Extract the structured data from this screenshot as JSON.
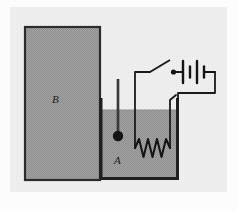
{
  "figure": {
    "type": "physics-apparatus-diagram",
    "width": 237,
    "height": 211,
    "background_color": "#f0f0f0",
    "frame_color": "#e8e8e8"
  },
  "labels": {
    "block": "B",
    "liquid": "A"
  },
  "components": {
    "block": {
      "name": "block-b",
      "shape": "rectangle",
      "fill_color": "#9b9b9b",
      "stroke_color": "#2b2b2b",
      "x": 25,
      "y": 27,
      "width": 75,
      "height": 153
    },
    "container": {
      "name": "beaker-container",
      "stroke_color": "#1f1f1f",
      "left_wall_x": 100,
      "right_wall_x": 178,
      "top_y": 98,
      "bottom_y": 180
    },
    "liquid": {
      "name": "liquid-a",
      "fill_color": "#9b9b9b",
      "surface_y": 110,
      "bottom_y": 177
    },
    "thermometer": {
      "name": "thermometer",
      "stem_color": "#2b2b2b",
      "bulb_color": "#1a1a1a",
      "x": 118,
      "top_y": 78,
      "bulb_y": 135,
      "bulb_radius": 5
    },
    "heating_coil": {
      "name": "heating-coil",
      "stroke_color": "#1a1a1a",
      "peaks": 4,
      "x_start": 136,
      "x_end": 170,
      "baseline_y": 148,
      "amplitude": 9
    },
    "switch": {
      "name": "open-switch",
      "state": "open",
      "pivot_x": 150,
      "pivot_y": 72,
      "lever_tip_x": 170,
      "lever_tip_y": 61,
      "terminal_x": 173,
      "terminal_y": 72
    },
    "battery": {
      "name": "battery",
      "cells": 2,
      "x": 182,
      "y": 72,
      "long_plate_height": 22,
      "short_plate_height": 11,
      "plate_spacing": 6
    },
    "wires": {
      "name": "circuit-wiring",
      "stroke_color": "#1a1a1a",
      "stroke_width": 1.6
    }
  },
  "colors": {
    "ink": "#1a1a1a",
    "gray_fill": "#9b9b9b",
    "paper": "#f0f0f0",
    "outer": "#fdfdfd"
  }
}
